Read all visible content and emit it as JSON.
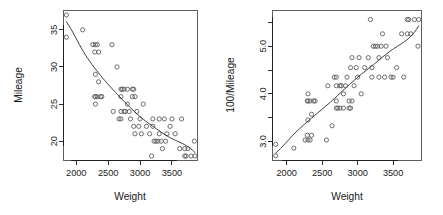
{
  "figure": {
    "background_color": "#ffffff",
    "point_color": "#555555",
    "line_color": "#3d3d3d",
    "axis_color": "#1a1a1a"
  },
  "chart_data": [
    {
      "type": "scatter",
      "panel": "left",
      "title": "",
      "xlabel": "Weight",
      "ylabel": "Mileage",
      "xlim": [
        1800,
        3900
      ],
      "ylim": [
        17.4,
        37.6
      ],
      "grid": false,
      "legend": null,
      "xticks": [
        2000,
        2500,
        3000,
        3500
      ],
      "xtick_labels": [
        "2000",
        "2500",
        "3000",
        "3500"
      ],
      "yticks": [
        20,
        25,
        30,
        35
      ],
      "ytick_labels": [
        "20",
        "25",
        "30",
        "35"
      ],
      "marker": "open-circle",
      "x": [
        1845,
        1845,
        2100,
        2260,
        2290,
        2290,
        2300,
        2300,
        2300,
        2300,
        2330,
        2330,
        2350,
        2350,
        2380,
        2400,
        2560,
        2580,
        2640,
        2670,
        2700,
        2700,
        2700,
        2700,
        2720,
        2750,
        2750,
        2770,
        2800,
        2800,
        2830,
        2850,
        2880,
        2880,
        2900,
        2900,
        2920,
        2920,
        2950,
        2980,
        3000,
        3020,
        3050,
        3100,
        3150,
        3180,
        3200,
        3200,
        3220,
        3250,
        3280,
        3300,
        3300,
        3330,
        3350,
        3380,
        3400,
        3420,
        3470,
        3500,
        3550,
        3620,
        3650,
        3700,
        3700,
        3720,
        3750,
        3800,
        3850,
        3860
      ],
      "y": [
        37,
        34,
        35,
        33,
        32,
        26,
        33,
        26,
        25,
        29,
        33,
        26,
        32,
        28,
        26,
        26,
        33,
        24,
        30,
        23,
        27,
        26,
        24,
        23,
        27,
        27,
        24,
        24,
        27,
        25,
        24,
        23,
        27,
        26,
        27,
        22,
        26,
        21,
        24,
        22,
        23,
        21,
        25,
        22,
        21,
        18,
        23,
        22,
        20,
        20,
        20,
        23,
        21,
        20,
        19,
        23,
        20,
        21,
        22,
        23,
        21,
        19,
        23,
        19,
        18,
        18,
        19,
        18,
        20,
        18
      ],
      "fit_curve_note": "smooth decreasing curve (lowess/spline) from upper-left to lower-right"
    },
    {
      "type": "scatter",
      "panel": "right",
      "title": "",
      "xlabel": "Weight",
      "ylabel": "100/Mileage",
      "xlim": [
        1800,
        3900
      ],
      "ylim": [
        2.6,
        5.75
      ],
      "grid": false,
      "legend": null,
      "xticks": [
        2000,
        2500,
        3000,
        3500
      ],
      "xtick_labels": [
        "2000",
        "2500",
        "3000",
        "3500"
      ],
      "yticks": [
        3.0,
        4.0,
        5.0
      ],
      "ytick_labels": [
        "3.0",
        "4.0",
        "5.0"
      ],
      "yticks_minor": [
        3.5,
        4.5,
        5.5
      ],
      "marker": "open-circle",
      "x": [
        1845,
        1845,
        2100,
        2260,
        2290,
        2290,
        2300,
        2300,
        2300,
        2300,
        2330,
        2330,
        2350,
        2350,
        2380,
        2400,
        2560,
        2580,
        2640,
        2670,
        2700,
        2700,
        2700,
        2700,
        2720,
        2750,
        2750,
        2770,
        2800,
        2800,
        2830,
        2850,
        2880,
        2880,
        2900,
        2900,
        2920,
        2920,
        2950,
        2980,
        3000,
        3020,
        3050,
        3100,
        3150,
        3180,
        3200,
        3200,
        3220,
        3250,
        3280,
        3300,
        3300,
        3330,
        3350,
        3380,
        3400,
        3420,
        3470,
        3500,
        3550,
        3620,
        3650,
        3700,
        3700,
        3720,
        3750,
        3800,
        3850,
        3860
      ],
      "y": [
        2.7,
        2.94,
        2.86,
        3.03,
        3.13,
        3.85,
        3.03,
        3.85,
        4.0,
        3.45,
        3.03,
        3.85,
        3.13,
        3.57,
        3.85,
        3.85,
        3.03,
        4.17,
        3.33,
        4.35,
        3.7,
        3.85,
        4.17,
        4.35,
        3.7,
        3.7,
        4.17,
        4.17,
        3.7,
        4.0,
        4.17,
        4.35,
        3.7,
        3.85,
        3.7,
        4.55,
        3.85,
        4.76,
        4.17,
        4.55,
        4.35,
        4.76,
        4.0,
        4.55,
        4.76,
        5.56,
        4.35,
        4.55,
        5.0,
        5.0,
        5.0,
        4.35,
        4.76,
        5.0,
        5.26,
        4.35,
        5.0,
        4.76,
        4.35,
        4.35,
        4.55,
        5.26,
        4.35,
        5.26,
        5.56,
        5.56,
        5.26,
        5.56,
        5.0,
        5.56
      ],
      "fit_curve_note": "nearly straight increasing line from lower-left to upper-right"
    }
  ]
}
